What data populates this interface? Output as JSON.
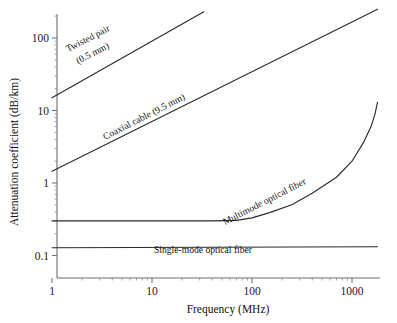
{
  "chart_data": {
    "type": "line",
    "title": "",
    "xlabel": "Frequency (MHz)",
    "ylabel": "Attenuation coefficient (dB/km)",
    "xscale": "log",
    "yscale": "log",
    "xlim": [
      1,
      2000
    ],
    "ylim": [
      0.1,
      300
    ],
    "xticks": [
      1,
      10,
      100,
      1000
    ],
    "xtick_labels": [
      "1",
      "10",
      "100",
      "1000"
    ],
    "yticks": [
      0.1,
      1,
      10,
      100
    ],
    "ytick_labels": [
      "0.1",
      "1",
      "10",
      "100"
    ],
    "grid": false,
    "legend_position": "inline-annotations",
    "series": [
      {
        "name": "Twisted pair (0.5 mm)",
        "label": "Twisted pair",
        "label_line2": "(0.5 mm)",
        "color": "#2b2b2b",
        "points": [
          [
            1,
            15
          ],
          [
            33,
            230
          ]
        ]
      },
      {
        "name": "Coaxial cable (9.5 mm)",
        "label": "Coaxial cable (9.5 mm)",
        "label_line2": "",
        "color": "#2b2b2b",
        "points": [
          [
            1,
            1.45
          ],
          [
            1800,
            250
          ]
        ]
      },
      {
        "name": "Multimode optical fiber",
        "label": "Multimode optical fiber",
        "label_line2": "",
        "color": "#2b2b2b",
        "points": [
          [
            1,
            0.3
          ],
          [
            10,
            0.3
          ],
          [
            40,
            0.3
          ],
          [
            70,
            0.305
          ],
          [
            100,
            0.33
          ],
          [
            150,
            0.39
          ],
          [
            250,
            0.5
          ],
          [
            400,
            0.72
          ],
          [
            700,
            1.2
          ],
          [
            1000,
            2.0
          ],
          [
            1300,
            3.6
          ],
          [
            1550,
            6.0
          ],
          [
            1700,
            9.0
          ],
          [
            1800,
            13
          ]
        ]
      },
      {
        "name": "Single-mode optical fiber",
        "label": "Single-mode optical fiber",
        "label_line2": "",
        "color": "#2b2b2b",
        "points": [
          [
            1,
            0.128
          ],
          [
            1800,
            0.132
          ]
        ]
      }
    ],
    "annotations": [
      {
        "text": "Twisted pair",
        "text2": "(0.5 mm)",
        "rotation": -27
      },
      {
        "text": "Coaxial cable (9.5 mm)",
        "text2": "",
        "rotation": -27
      },
      {
        "text": "Multimode optical fiber",
        "text2": "",
        "rotation": -27
      },
      {
        "text": "Single-mode optical fiber",
        "text2": "",
        "rotation": 0
      }
    ]
  }
}
